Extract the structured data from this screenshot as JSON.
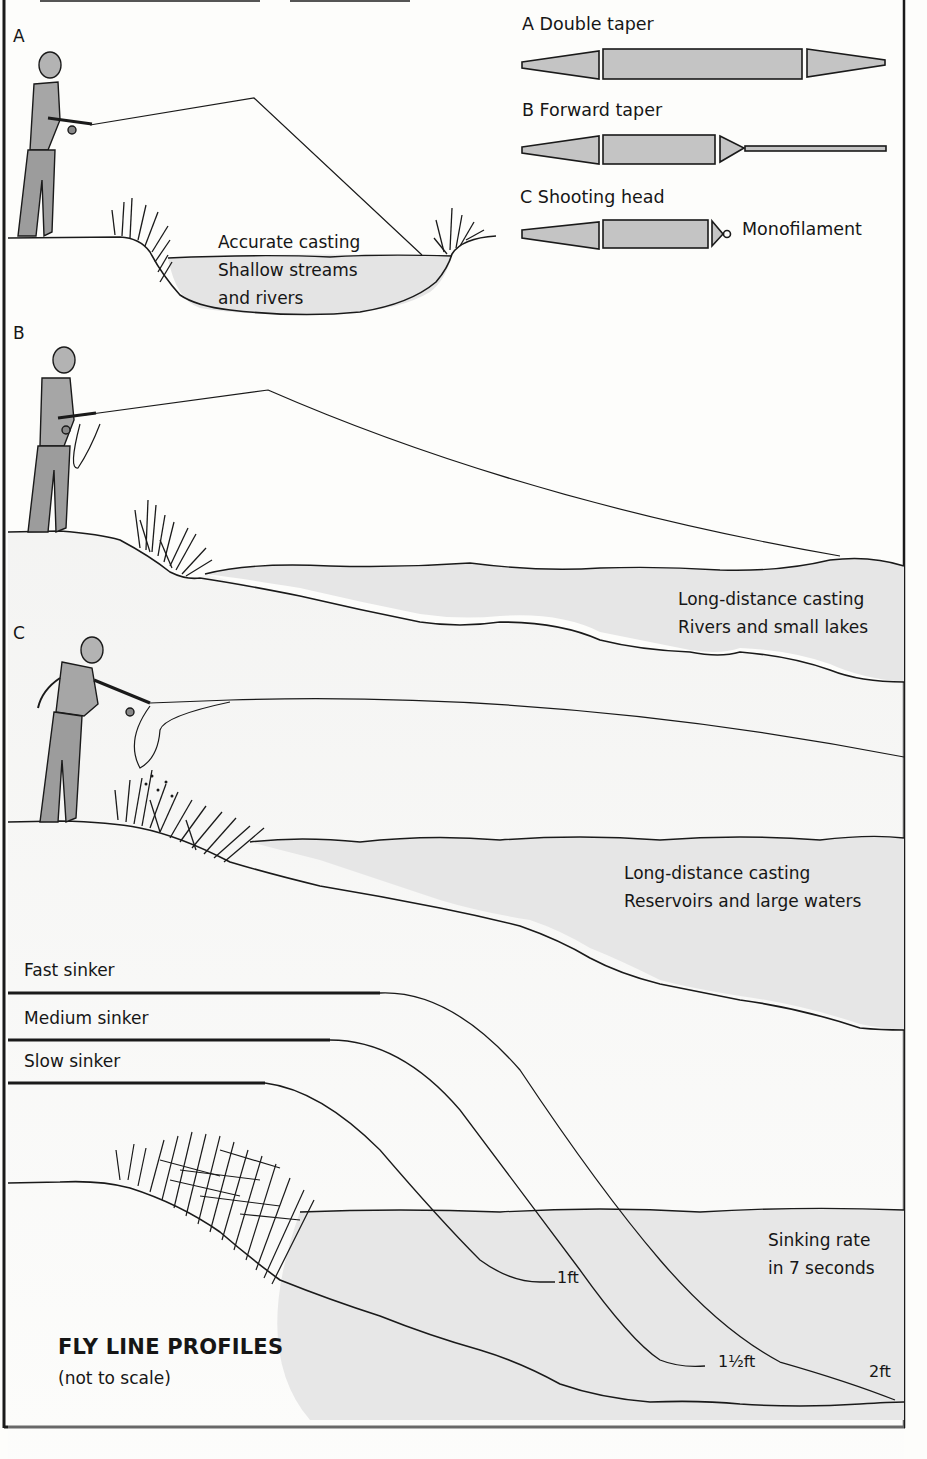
{
  "figure": {
    "title": "FLY LINE PROFILES",
    "subtitle": "(not to scale)"
  },
  "taper_legend": {
    "items": [
      {
        "letter": "A",
        "label": "A Double taper"
      },
      {
        "letter": "B",
        "label": "B Forward taper"
      },
      {
        "letter": "C",
        "label": "C Shooting head",
        "annotation": "Monofilament"
      }
    ]
  },
  "panels": [
    {
      "letter": "A",
      "lines": [
        "Accurate casting",
        "Shallow streams",
        "and rivers"
      ]
    },
    {
      "letter": "B",
      "lines": [
        "Long-distance casting",
        "Rivers and small lakes"
      ]
    },
    {
      "letter": "C",
      "lines": [
        "Long-distance casting",
        "Reservoirs and large waters"
      ]
    }
  ],
  "sinking": {
    "lines": [
      {
        "label": "Fast sinker",
        "depth": "2ft"
      },
      {
        "label": "Medium sinker",
        "depth": "1½ft"
      },
      {
        "label": "Slow sinker",
        "depth": "1ft"
      }
    ],
    "note": [
      "Sinking rate",
      "in 7 seconds"
    ]
  },
  "colors": {
    "ink": "#161616",
    "line_fill": "#bdbdbd",
    "water": "#e6e6e6",
    "bank": "#f1f1f1",
    "figure_fill": "#a9a9a9"
  }
}
